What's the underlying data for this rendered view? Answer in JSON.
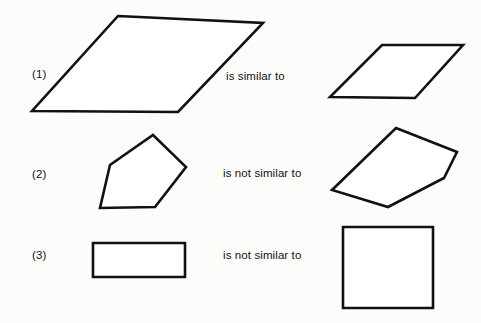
{
  "page": {
    "background_color": "#fcfcfb",
    "stroke_color": "#111111",
    "fill_color": "#ffffff",
    "width": 481,
    "height": 323
  },
  "rows": [
    {
      "label": "(1)",
      "relation": "is similar to",
      "left_shape": {
        "name": "large-parallelogram",
        "points": "118,16 263,23 178,112 32,111"
      },
      "right_shape": {
        "name": "small-parallelogram",
        "points": "382,45 463,45 415,98 330,97"
      }
    },
    {
      "label": "(2)",
      "relation": "is not similar to",
      "left_shape": {
        "name": "pentagon-upright",
        "points": "153,135 186,167 155,207 100,208 110,165"
      },
      "right_shape": {
        "name": "pentagon-tilted",
        "points": "396,128 457,152 444,178 388,207 332,190"
      }
    },
    {
      "label": "(3)",
      "relation": "is not similar to",
      "left_shape": {
        "name": "rectangle",
        "points": "93,243 185,243 185,277 93,277"
      },
      "right_shape": {
        "name": "square",
        "points": "343,227 433,227 433,308 343,308"
      }
    }
  ]
}
